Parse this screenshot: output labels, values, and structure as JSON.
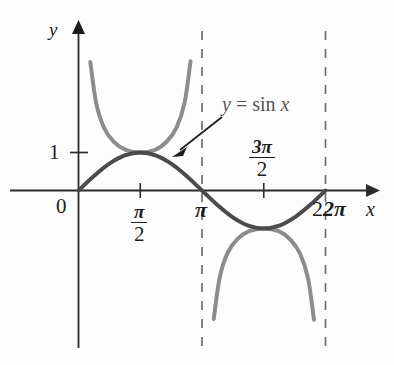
{
  "figure": {
    "kind": "math-graph",
    "background": "#ffffff"
  },
  "axes": {
    "y_axis_label": "y",
    "x_axis_label": "x",
    "origin_label": "0",
    "y_tick_label": "1",
    "x_ticks": [
      {
        "label_num": "π",
        "label_den": "2",
        "kind": "fraction"
      },
      {
        "label_num": "π",
        "kind": "plain"
      },
      {
        "label_num": "3π",
        "label_den": "2",
        "kind": "fraction"
      },
      {
        "label_num": "2π",
        "kind": "plain"
      }
    ],
    "axis_color": "#2b2b2b"
  },
  "curves": {
    "sine": {
      "label_y": "y",
      "label_eq": "=",
      "label_fn": "sin",
      "label_var": "x",
      "color": "#4b4b4b"
    },
    "cosecant": {
      "color": "#8c8c8c"
    },
    "asymptotes": {
      "color": "#6e6e6e",
      "positions": [
        "π",
        "2π"
      ]
    }
  },
  "chart_data": {
    "type": "line",
    "title": "",
    "subtitle": "",
    "xlabel": "x",
    "ylabel": "y",
    "xlim": [
      -0.35,
      7.35
    ],
    "ylim": [
      -3.6,
      3.6
    ],
    "grid": false,
    "legend": "inline-annotation",
    "annotations": [
      {
        "text": "y = sin x",
        "x": 3.9,
        "y": 2.1,
        "arrow_to_x": 2.2,
        "arrow_to_y": 0.85
      }
    ],
    "xticks": [
      {
        "value": 0,
        "label": "0"
      },
      {
        "value": 1.5708,
        "label": "π/2"
      },
      {
        "value": 3.1416,
        "label": "π"
      },
      {
        "value": 4.7124,
        "label": "3π/2"
      },
      {
        "value": 6.2832,
        "label": "2π"
      }
    ],
    "yticks": [
      {
        "value": 1,
        "label": "1"
      }
    ],
    "series": [
      {
        "name": "y = sin x",
        "color": "#4b4b4b",
        "domain": [
          0,
          6.2832
        ],
        "points": [
          {
            "x": 0.0,
            "y": 0.0
          },
          {
            "x": 0.3927,
            "y": 0.3827
          },
          {
            "x": 0.7854,
            "y": 0.7071
          },
          {
            "x": 1.1781,
            "y": 0.9239
          },
          {
            "x": 1.5708,
            "y": 1.0
          },
          {
            "x": 1.9635,
            "y": 0.9239
          },
          {
            "x": 2.3562,
            "y": 0.7071
          },
          {
            "x": 2.7489,
            "y": 0.3827
          },
          {
            "x": 3.1416,
            "y": 0.0
          },
          {
            "x": 3.5343,
            "y": -0.3827
          },
          {
            "x": 3.927,
            "y": -0.7071
          },
          {
            "x": 4.3197,
            "y": -0.9239
          },
          {
            "x": 4.7124,
            "y": -1.0
          },
          {
            "x": 5.1051,
            "y": -0.9239
          },
          {
            "x": 5.4978,
            "y": -0.7071
          },
          {
            "x": 5.8905,
            "y": -0.3827
          },
          {
            "x": 6.2832,
            "y": 0.0
          }
        ]
      },
      {
        "name": "y = csc x (branch 1)",
        "color": "#8c8c8c",
        "domain": [
          0.28,
          2.86
        ],
        "points": [
          {
            "x": 0.3,
            "y": 3.38
          },
          {
            "x": 0.45,
            "y": 2.3
          },
          {
            "x": 0.65,
            "y": 1.65
          },
          {
            "x": 0.9,
            "y": 1.28
          },
          {
            "x": 1.2,
            "y": 1.07
          },
          {
            "x": 1.5708,
            "y": 1.0
          },
          {
            "x": 1.95,
            "y": 1.07
          },
          {
            "x": 2.25,
            "y": 1.29
          },
          {
            "x": 2.5,
            "y": 1.67
          },
          {
            "x": 2.7,
            "y": 2.32
          },
          {
            "x": 2.85,
            "y": 3.4
          }
        ]
      },
      {
        "name": "y = csc x (branch 2)",
        "color": "#8c8c8c",
        "domain": [
          3.42,
          6.0
        ],
        "points": [
          {
            "x": 3.44,
            "y": -3.38
          },
          {
            "x": 3.59,
            "y": -2.3
          },
          {
            "x": 3.79,
            "y": -1.65
          },
          {
            "x": 4.04,
            "y": -1.28
          },
          {
            "x": 4.34,
            "y": -1.07
          },
          {
            "x": 4.7124,
            "y": -1.0
          },
          {
            "x": 5.09,
            "y": -1.07
          },
          {
            "x": 5.39,
            "y": -1.29
          },
          {
            "x": 5.64,
            "y": -1.67
          },
          {
            "x": 5.84,
            "y": -2.32
          },
          {
            "x": 5.99,
            "y": -3.4
          }
        ]
      }
    ],
    "asymptotes": [
      {
        "x": 3.1416,
        "style": "dashed"
      },
      {
        "x": 6.2832,
        "style": "dashed"
      }
    ]
  }
}
